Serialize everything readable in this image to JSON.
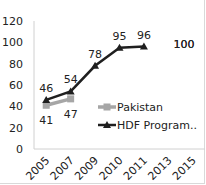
{
  "chart_data": {
    "type": "line",
    "title": "",
    "xlabel": "",
    "ylabel": "",
    "categories": [
      "2005",
      "2007",
      "2009",
      "2010",
      "2011",
      "2013",
      "2015"
    ],
    "ylim": [
      0,
      120
    ],
    "yticks": [
      "0",
      "20",
      "40",
      "60",
      "80",
      "100",
      "120"
    ],
    "grid": false,
    "legend_position": "inside-right",
    "series": [
      {
        "name": "Pakistan",
        "color": "#a6a6a6",
        "marker": "square",
        "values": [
          41,
          47,
          null,
          null,
          null,
          null,
          100
        ],
        "labels": [
          "41",
          "47",
          "",
          "",
          "",
          "",
          "100"
        ]
      },
      {
        "name": "HDF Program..",
        "color": "#1f1f1f",
        "marker": "triangle",
        "values": [
          46,
          54,
          78,
          95,
          96,
          null,
          100
        ],
        "labels": [
          "46",
          "54",
          "78",
          "95",
          "96",
          "",
          "100"
        ]
      }
    ]
  },
  "legend": {
    "items": [
      "Pakistan",
      "HDF Program.."
    ]
  }
}
